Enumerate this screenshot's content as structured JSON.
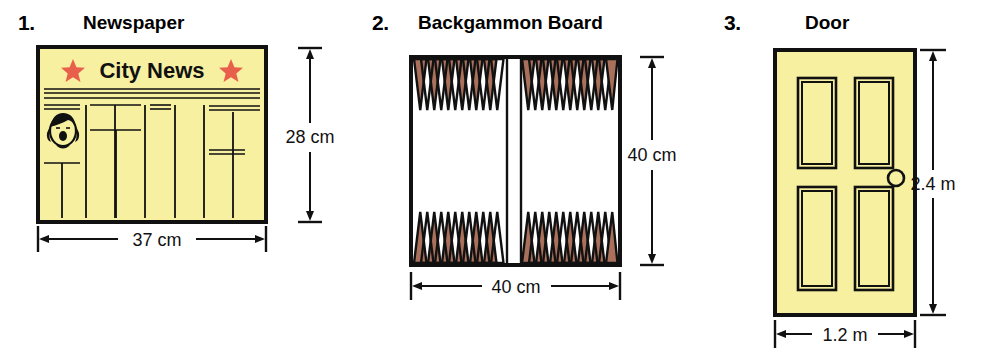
{
  "page": {
    "background_color": "#ffffff",
    "ink_color": "#1a1a1a"
  },
  "palette": {
    "paper_yellow": "#f6f0a0",
    "door_yellow": "#f6f0a0",
    "backgammon_brown": "#a9705c",
    "star_red": "#e8604c",
    "outline": "#111111",
    "white": "#ffffff"
  },
  "figures": [
    {
      "number": "1.",
      "title": "Newspaper",
      "masthead": "City News",
      "star_glyph": "star-icon",
      "dimensions": {
        "height_label": "28 cm",
        "width_label": "37 cm"
      }
    },
    {
      "number": "2.",
      "title": "Backgammon Board",
      "dimensions": {
        "height_label": "40 cm",
        "width_label": "40 cm"
      },
      "points_per_quadrant": 6,
      "quadrants": 4
    },
    {
      "number": "3.",
      "title": "Door",
      "dimensions": {
        "height_label": "2.4 m",
        "width_label": "1.2 m"
      },
      "panels": 4,
      "knob": "doorknob-icon"
    }
  ]
}
